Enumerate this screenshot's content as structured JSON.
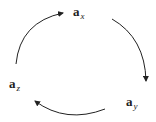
{
  "diagram": {
    "type": "cycle",
    "nodes": [
      {
        "id": "x",
        "base": "a",
        "subscript": "x"
      },
      {
        "id": "y",
        "base": "a",
        "subscript": "y"
      },
      {
        "id": "z",
        "base": "a",
        "subscript": "z"
      }
    ],
    "edges": [
      {
        "from": "x",
        "to": "y"
      },
      {
        "from": "y",
        "to": "z"
      },
      {
        "from": "z",
        "to": "x"
      }
    ],
    "colors": {
      "stroke": "#222222",
      "background": "#ffffff"
    }
  }
}
